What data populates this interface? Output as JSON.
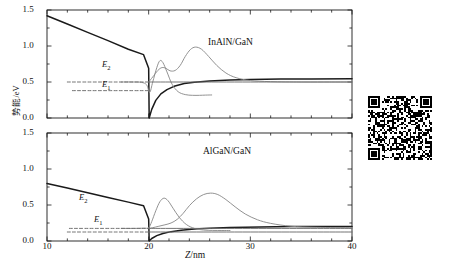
{
  "figure": {
    "y_axis_label": "势能/eV",
    "x_axis_label_var": "Z",
    "x_axis_label_unit": "/nm",
    "x_ticks": [
      "10",
      "20",
      "30",
      "40"
    ],
    "y_ticks": [
      "0.0",
      "0.5",
      "1.0",
      "1.5"
    ],
    "colors": {
      "band": "#1a1a1a",
      "wavefunction": "#8c8c8c",
      "level": "#6b6b6b",
      "axis": "#1a1a1a"
    }
  },
  "panels": [
    {
      "id": "top",
      "title": "InAlN/GaN",
      "levels": [
        {
          "name": "E2",
          "label": "E",
          "sub": "2",
          "value": 0.5
        },
        {
          "name": "E1",
          "label": "E",
          "sub": "1",
          "value": 0.38
        }
      ]
    },
    {
      "id": "bottom",
      "title": "AlGaN/GaN",
      "levels": [
        {
          "name": "E2",
          "label": "E",
          "sub": "2",
          "value": 0.175
        },
        {
          "name": "E1",
          "label": "E",
          "sub": "1",
          "value": 0.125
        }
      ]
    }
  ],
  "qr_code": {
    "alt": "qr-code",
    "modules": 37,
    "seed": 20240517
  },
  "chart_data": {
    "type": "line",
    "title": "",
    "xlabel": "Z/nm",
    "ylabel": "势能/eV",
    "xlim": [
      10,
      40
    ],
    "ylim": [
      0.0,
      1.5
    ],
    "xticks": [
      10,
      20,
      30,
      40
    ],
    "yticks": [
      0.0,
      0.5,
      1.0,
      1.5
    ],
    "grid": false,
    "legend": "none",
    "subplots": [
      {
        "name": "InAlN/GaN",
        "annotation": "InAlN/GaN",
        "series": [
          {
            "name": "conduction-band-profile",
            "style": "solid",
            "color": "#1a1a1a",
            "x": [
              10,
              12,
              14,
              16,
              18,
              19.5,
              20.0,
              20.05,
              20.3,
              20.7,
              21.2,
              21.8,
              22.5,
              23.5,
              24.5,
              26,
              28,
              30,
              33,
              36,
              40
            ],
            "y": [
              1.42,
              1.305,
              1.19,
              1.075,
              0.955,
              0.88,
              0.69,
              0.0,
              0.12,
              0.245,
              0.335,
              0.395,
              0.44,
              0.478,
              0.498,
              0.515,
              0.528,
              0.534,
              0.54,
              0.543,
              0.545
            ]
          },
          {
            "name": "wavefunction-psi1",
            "style": "solid",
            "color": "#8c8c8c",
            "x": [
              17.3,
              18.5,
              19.3,
              19.8,
              20.1,
              20.4,
              20.8,
              21.1,
              21.4,
              21.8,
              22.3,
              22.9,
              23.6,
              24.3,
              25.0,
              25.6,
              26.2
            ],
            "y": [
              0.5,
              0.5,
              0.495,
              0.46,
              0.355,
              0.5,
              0.7,
              0.795,
              0.77,
              0.64,
              0.47,
              0.365,
              0.325,
              0.315,
              0.315,
              0.318,
              0.32
            ]
          },
          {
            "name": "wavefunction-psi2",
            "style": "solid",
            "color": "#8c8c8c",
            "x": [
              20.0,
              20.4,
              20.9,
              21.3,
              21.7,
              22.1,
              22.6,
              23.1,
              23.6,
              24.1,
              24.6,
              25.2,
              25.9,
              26.7,
              27.6,
              28.6,
              30.0,
              32.0,
              35.0,
              38.0,
              40.0
            ],
            "y": [
              0.5,
              0.57,
              0.66,
              0.7,
              0.69,
              0.655,
              0.66,
              0.73,
              0.855,
              0.95,
              0.985,
              0.955,
              0.855,
              0.73,
              0.625,
              0.56,
              0.52,
              0.505,
              0.5,
              0.5,
              0.5
            ]
          },
          {
            "name": "energy-level-E2",
            "style": "dashed",
            "color": "#6b6b6b",
            "x": [
              12.0,
              20.0
            ],
            "y": [
              0.5,
              0.5
            ]
          },
          {
            "name": "energy-level-E1",
            "style": "dashed",
            "color": "#6b6b6b",
            "x": [
              12.5,
              20.0
            ],
            "y": [
              0.38,
              0.38
            ]
          },
          {
            "name": "baseline-level-right",
            "style": "solid",
            "color": "#6b6b6b",
            "x": [
              20.0,
              40.0
            ],
            "y": [
              0.5,
              0.5
            ]
          }
        ]
      },
      {
        "name": "AlGaN/GaN",
        "annotation": "AlGaN/GaN",
        "series": [
          {
            "name": "conduction-band-profile",
            "style": "solid",
            "color": "#1a1a1a",
            "x": [
              10,
              12,
              14,
              16,
              18,
              19.5,
              20.0,
              20.05,
              20.3,
              20.8,
              21.4,
              22.2,
              23.2,
              24.5,
              26,
              28,
              31,
              34,
              37,
              40
            ],
            "y": [
              0.8,
              0.735,
              0.67,
              0.605,
              0.54,
              0.49,
              0.305,
              0.0,
              0.035,
              0.075,
              0.105,
              0.13,
              0.15,
              0.165,
              0.178,
              0.188,
              0.196,
              0.2,
              0.202,
              0.203
            ]
          },
          {
            "name": "wavefunction-psi1",
            "style": "solid",
            "color": "#8c8c8c",
            "x": [
              17.3,
              18.6,
              19.5,
              20.0,
              20.3,
              20.7,
              21.1,
              21.5,
              21.9,
              22.4,
              23.0,
              23.7,
              24.5,
              25.4,
              26.3,
              27.2,
              28.0
            ],
            "y": [
              0.175,
              0.175,
              0.178,
              0.185,
              0.27,
              0.42,
              0.545,
              0.595,
              0.56,
              0.455,
              0.33,
              0.23,
              0.175,
              0.152,
              0.147,
              0.146,
              0.146
            ]
          },
          {
            "name": "wavefunction-psi2",
            "style": "solid",
            "color": "#8c8c8c",
            "x": [
              20.0,
              20.4,
              21.0,
              21.6,
              22.2,
              22.8,
              23.4,
              24.0,
              24.7,
              25.4,
              26.1,
              26.8,
              27.6,
              28.5,
              29.5,
              30.7,
              32.0,
              34.0,
              36.5,
              40.0
            ],
            "y": [
              0.175,
              0.185,
              0.205,
              0.225,
              0.25,
              0.3,
              0.385,
              0.49,
              0.585,
              0.645,
              0.665,
              0.645,
              0.575,
              0.475,
              0.375,
              0.295,
              0.245,
              0.205,
              0.19,
              0.185
            ]
          },
          {
            "name": "energy-level-E2",
            "style": "dashed",
            "color": "#6b6b6b",
            "x": [
              12.2,
              20.0
            ],
            "y": [
              0.175,
              0.175
            ]
          },
          {
            "name": "energy-level-E1",
            "style": "dashed",
            "color": "#6b6b6b",
            "x": [
              12.0,
              20.0
            ],
            "y": [
              0.125,
              0.125
            ]
          },
          {
            "name": "baseline-level-right",
            "style": "solid",
            "color": "#6b6b6b",
            "x": [
              20.0,
              40.0
            ],
            "y": [
              0.125,
              0.125
            ]
          },
          {
            "name": "plateau-level-right",
            "style": "solid",
            "color": "#6b6b6b",
            "x": [
              20.0,
              40.0
            ],
            "y": [
              0.175,
              0.175
            ]
          }
        ]
      }
    ]
  }
}
